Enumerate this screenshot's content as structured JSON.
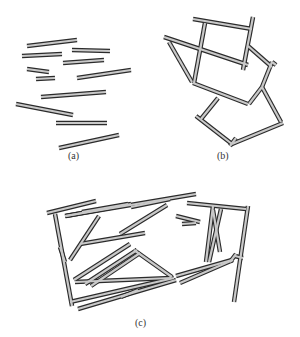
{
  "colors": {
    "fill": "#c9c9c9",
    "outline": "#2b2b2b"
  },
  "panels": [
    {
      "id": "a",
      "caption": "(a)",
      "caption_pos": [
        75,
        157
      ],
      "segments": [
        [
          27,
          46,
          77,
          40
        ],
        [
          22,
          56,
          62,
          54
        ],
        [
          72,
          50,
          110,
          51
        ],
        [
          63,
          63,
          104,
          60
        ],
        [
          27,
          69,
          49,
          72
        ],
        [
          36,
          79,
          55,
          78
        ],
        [
          77,
          78,
          131,
          70
        ],
        [
          41,
          97,
          106,
          92
        ],
        [
          16,
          104,
          73,
          115
        ],
        [
          56,
          123,
          107,
          123
        ],
        [
          59,
          148,
          119,
          135
        ]
      ]
    },
    {
      "id": "b",
      "caption": "(b)",
      "caption_pos": [
        224,
        157
      ],
      "segments": [
        [
          193,
          19,
          252,
          29
        ],
        [
          253,
          17,
          243,
          70
        ],
        [
          205,
          23,
          194,
          83
        ],
        [
          164,
          37,
          248,
          65
        ],
        [
          169,
          42,
          192,
          82
        ],
        [
          193,
          83,
          248,
          104
        ],
        [
          249,
          104,
          262,
          87
        ],
        [
          248,
          46,
          272,
          67
        ],
        [
          276,
          65,
          272,
          62
        ],
        [
          272,
          62,
          262,
          87
        ],
        [
          262,
          87,
          281,
          122
        ],
        [
          218,
          98,
          201,
          119
        ],
        [
          196,
          116,
          232,
          144
        ],
        [
          232,
          144,
          283,
          123
        ],
        [
          230,
          146,
          236,
          138
        ]
      ]
    },
    {
      "id": "c",
      "caption": "(c)",
      "caption_pos": [
        142,
        324
      ],
      "segments": [
        [
          47,
          213,
          96,
          201
        ],
        [
          66,
          216,
          131,
          204
        ],
        [
          55,
          214,
          72,
          306
        ],
        [
          65,
          216,
          196,
          194
        ],
        [
          82,
          212,
          128,
          204
        ],
        [
          131,
          207,
          170,
          199
        ],
        [
          60,
          247,
          65,
          262
        ],
        [
          70,
          260,
          99,
          216
        ],
        [
          80,
          244,
          145,
          233
        ],
        [
          120,
          234,
          167,
          205
        ],
        [
          176,
          216,
          200,
          222
        ],
        [
          182,
          224,
          196,
          223
        ],
        [
          187,
          203,
          246,
          209
        ],
        [
          213,
          206,
          206,
          262
        ],
        [
          213,
          210,
          220,
          252
        ],
        [
          221,
          209,
          209,
          262
        ],
        [
          248,
          206,
          234,
          302
        ],
        [
          74,
          280,
          130,
          244
        ],
        [
          85,
          284,
          137,
          250
        ],
        [
          91,
          286,
          140,
          253
        ],
        [
          75,
          282,
          171,
          278
        ],
        [
          70,
          302,
          174,
          278
        ],
        [
          134,
          250,
          172,
          277
        ],
        [
          78,
          309,
          176,
          280
        ],
        [
          176,
          276,
          232,
          260
        ],
        [
          180,
          283,
          233,
          260
        ],
        [
          121,
          297,
          138,
          290
        ],
        [
          230,
          262,
          236,
          254
        ],
        [
          235,
          256,
          243,
          258
        ]
      ]
    }
  ]
}
